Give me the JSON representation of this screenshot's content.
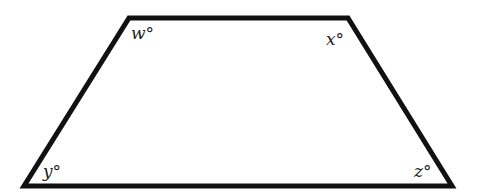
{
  "diagram": {
    "shape": "trapezoid",
    "stroke_color": "#111111",
    "vertices": {
      "top_left": [
        129,
        18
      ],
      "top_right": [
        348,
        18
      ],
      "bottom_right": [
        452,
        186
      ],
      "bottom_left": [
        24,
        186
      ]
    },
    "angles": [
      {
        "vertex": "top_left",
        "label": "w°"
      },
      {
        "vertex": "top_right",
        "label": "x°"
      },
      {
        "vertex": "bottom_left",
        "label": "y°"
      },
      {
        "vertex": "bottom_right",
        "label": "z°"
      }
    ]
  }
}
